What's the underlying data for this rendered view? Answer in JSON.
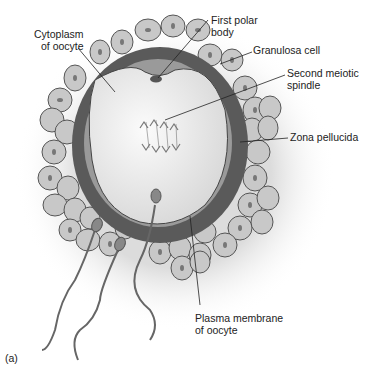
{
  "diagram": {
    "panel_label": "(a)",
    "labels": [
      {
        "id": "cytoplasm",
        "text": "Cytoplasm\nof oocyte"
      },
      {
        "id": "first_polar_body",
        "text": "First polar\nbody"
      },
      {
        "id": "granulosa_cell",
        "text": "Granulosa cell"
      },
      {
        "id": "second_meiotic_spindle",
        "text": "Second meiotic\nspindle"
      },
      {
        "id": "zona_pellucida",
        "text": "Zona pellucida"
      },
      {
        "id": "plasma_membrane",
        "text": "Plasma membrane\nof oocyte"
      }
    ],
    "colors": {
      "zona": "#5a5a5a",
      "membrane_band": "#9a9a9a",
      "cytoplasm": "#eeeeee",
      "cell_fill": "#c8c8c8",
      "cell_stroke": "#555555",
      "nucleus": "#777777",
      "sperm": "#666666",
      "leader": "#222222"
    }
  }
}
